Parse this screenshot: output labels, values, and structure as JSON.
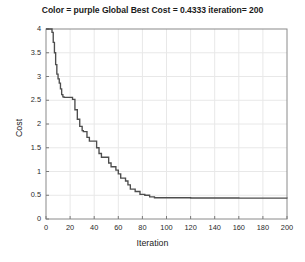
{
  "chart_data": {
    "type": "line",
    "title": "Color = purple Global Best Cost = 0.4333 iteration= 200",
    "xlabel": "Iteration",
    "ylabel": "Cost",
    "xlim": [
      0,
      200
    ],
    "ylim": [
      0,
      4
    ],
    "xticks": [
      0,
      20,
      40,
      60,
      80,
      100,
      120,
      140,
      160,
      180,
      200
    ],
    "yticks": [
      0,
      0.5,
      1,
      1.5,
      2,
      2.5,
      3,
      3.5,
      4
    ],
    "xtick_labels": [
      "0",
      "20",
      "40",
      "60",
      "80",
      "100",
      "120",
      "140",
      "160",
      "180",
      "200"
    ],
    "ytick_labels": [
      "0",
      "0.5",
      "1",
      "1.5",
      "2",
      "2.5",
      "3",
      "3.5",
      "4"
    ],
    "grid": true,
    "legend": "none",
    "line_color": "#4d4d4d",
    "grid_color": "#e8e8e8",
    "axis_color": "#7a7a7a",
    "series": [
      {
        "name": "Global Best Cost",
        "step": "post",
        "x": [
          0,
          4,
          5,
          6,
          7,
          8,
          9,
          10,
          11,
          12,
          13,
          14,
          15,
          16,
          17,
          18,
          20,
          22,
          24,
          26,
          28,
          30,
          31,
          32,
          34,
          36,
          38,
          40,
          42,
          44,
          46,
          48,
          50,
          52,
          54,
          56,
          58,
          60,
          62,
          64,
          66,
          68,
          70,
          74,
          78,
          82,
          86,
          90,
          120,
          160,
          200
        ],
        "y": [
          4.0,
          4.0,
          3.93,
          3.72,
          3.5,
          3.25,
          3.05,
          2.95,
          2.86,
          2.74,
          2.62,
          2.57,
          2.56,
          2.56,
          2.56,
          2.56,
          2.56,
          2.52,
          2.3,
          2.1,
          1.95,
          1.86,
          1.84,
          1.84,
          1.72,
          1.64,
          1.64,
          1.64,
          1.5,
          1.38,
          1.3,
          1.3,
          1.3,
          1.18,
          1.1,
          1.1,
          1.03,
          0.95,
          0.86,
          0.86,
          0.8,
          0.72,
          0.63,
          0.58,
          0.52,
          0.5,
          0.4667,
          0.4482,
          0.4415,
          0.4382,
          0.4333
        ]
      }
    ],
    "final_value": 0.4333,
    "final_iteration": 200
  },
  "plot_geometry": {
    "left": 46,
    "right": 287,
    "top": 29,
    "bottom": 219
  }
}
